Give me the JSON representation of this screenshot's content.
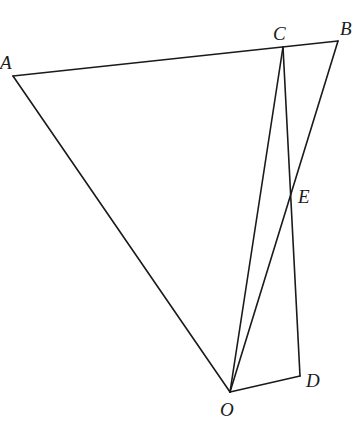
{
  "diagram": {
    "points": {
      "A": {
        "label": "A",
        "x": 13,
        "y": 76
      },
      "B": {
        "label": "B",
        "x": 338,
        "y": 41
      },
      "C": {
        "label": "C",
        "x": 283,
        "y": 47
      },
      "D": {
        "label": "D",
        "x": 300,
        "y": 376
      },
      "E": {
        "label": "E",
        "x": 290,
        "y": 193
      },
      "O": {
        "label": "O",
        "x": 230,
        "y": 392
      }
    },
    "segments": [
      "AB",
      "AO",
      "BO",
      "CO",
      "CD",
      "OD"
    ],
    "colors": {
      "line": "#1a1a1a",
      "background": "#ffffff"
    }
  }
}
